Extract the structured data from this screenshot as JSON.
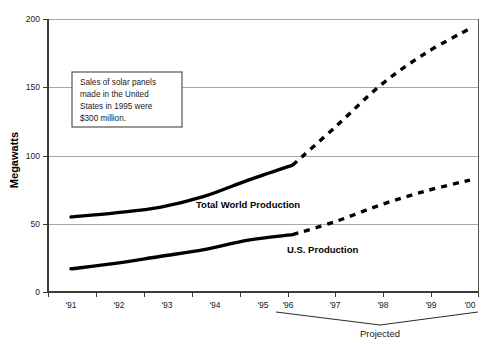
{
  "chart_data": {
    "type": "line",
    "title": "",
    "xlabel": "",
    "ylabel": "Megawatts",
    "xlim": [
      1991,
      2000
    ],
    "ylim": [
      0,
      200
    ],
    "grid": true,
    "legend_position": "inline-labels",
    "x": [
      "'91",
      "'92",
      "'93",
      "'94",
      "'95",
      "'96",
      "'97",
      "'98",
      "'99",
      "'00"
    ],
    "ytick_labels": [
      "0",
      "50",
      "100",
      "150",
      "200"
    ],
    "ytick_values": [
      0,
      50,
      100,
      150,
      200
    ],
    "series": [
      {
        "name": "Total World Production",
        "values": [
          55,
          58,
          62,
          70,
          82,
          93,
          122,
          152,
          175,
          193
        ],
        "solid_through": "'96",
        "style": "solid-then-dashed"
      },
      {
        "name": "U.S. Production",
        "values": [
          17,
          21,
          26,
          31,
          38,
          42,
          52,
          64,
          74,
          82
        ],
        "solid_through": "'96",
        "style": "solid-then-dashed"
      }
    ],
    "annotations": [
      {
        "id": "callout",
        "lines": [
          "Sales of solar panels",
          "made in the United",
          "States in 1995 were",
          "$300 million."
        ]
      },
      {
        "id": "projected-bracket",
        "label": "Projected",
        "spans": [
          "'96",
          "'00"
        ]
      }
    ]
  },
  "labels": {
    "y_axis_title": "Megawatts",
    "series_world": "Total World Production",
    "series_us": "U.S. Production",
    "projected": "Projected"
  },
  "callout": {
    "line1": "Sales of solar panels",
    "line2": "made in the United",
    "line3": "States in 1995 were",
    "line4": "$300 million."
  },
  "yticks": {
    "t0": "0",
    "t1": "50",
    "t2": "100",
    "t3": "150",
    "t4": "200"
  },
  "xticks": {
    "t0": "'91",
    "t1": "'92",
    "t2": "'93",
    "t3": "'94",
    "t4": "'95",
    "t5": "'96",
    "t6": "'97",
    "t7": "'98",
    "t8": "'99",
    "t9": "'00"
  },
  "colors": {
    "line": "#000000",
    "grid": "#a8a8a8",
    "axis": "#3a3a3a",
    "background": "#ffffff"
  },
  "footer": {
    "ghost_text": ""
  }
}
